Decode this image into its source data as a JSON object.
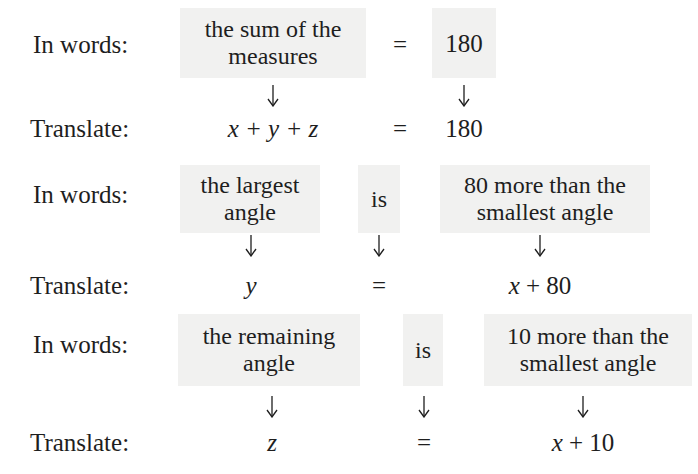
{
  "block1": {
    "words_label": "In words:",
    "translate_label": "Translate:",
    "phrase_left": [
      "the sum of the",
      "measures"
    ],
    "equals_word": "=",
    "phrase_right": "180",
    "expr_left": "x + y + z",
    "expr_equals": "=",
    "expr_right": "180"
  },
  "block2": {
    "words_label": "In words:",
    "translate_label": "Translate:",
    "phrase_left": [
      "the largest",
      "angle"
    ],
    "verb": "is",
    "phrase_right": [
      "80 more than the",
      "smallest angle"
    ],
    "expr_left": "y",
    "expr_equals": "=",
    "expr_right": "x + 80"
  },
  "block3": {
    "words_label": "In words:",
    "translate_label": "Translate:",
    "phrase_left": [
      "the remaining",
      "angle"
    ],
    "verb": "is",
    "phrase_right": [
      "10 more than the",
      "smallest angle"
    ],
    "expr_left": "z",
    "expr_equals": "=",
    "expr_right": "x + 10"
  },
  "icons": {
    "arrow": "down-arrow-icon"
  },
  "colors": {
    "box_shade": "#f1f1f0",
    "text": "#1e1e1e"
  }
}
